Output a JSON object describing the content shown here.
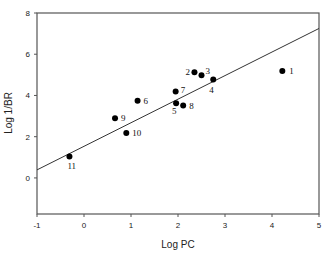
{
  "chart_data": {
    "type": "scatter",
    "title": "",
    "xlabel": "Log PC",
    "ylabel": "Log 1/BR",
    "xlim": [
      -1,
      5
    ],
    "ylim": [
      -1.75,
      8
    ],
    "xticks": [
      -1,
      0,
      1,
      2,
      3,
      4,
      5
    ],
    "yticks": [
      0,
      2,
      4,
      6,
      8
    ],
    "grid": false,
    "legend": null,
    "points": [
      {
        "label": "1",
        "x": 4.22,
        "y": 5.19
      },
      {
        "label": "2",
        "x": 2.35,
        "y": 5.12
      },
      {
        "label": "3",
        "x": 2.5,
        "y": 4.98
      },
      {
        "label": "4",
        "x": 2.75,
        "y": 4.77
      },
      {
        "label": "5",
        "x": 1.96,
        "y": 3.62
      },
      {
        "label": "6",
        "x": 1.14,
        "y": 3.74
      },
      {
        "label": "7",
        "x": 1.95,
        "y": 4.19
      },
      {
        "label": "8",
        "x": 2.11,
        "y": 3.51
      },
      {
        "label": "9",
        "x": 0.66,
        "y": 2.89
      },
      {
        "label": "10",
        "x": 0.9,
        "y": 2.18
      },
      {
        "label": "11",
        "x": -0.31,
        "y": 1.04
      }
    ],
    "regression_line": {
      "x": [
        -1,
        5
      ],
      "y": [
        0.39,
        7.25
      ],
      "slope": 1.14,
      "intercept": 1.53
    }
  }
}
